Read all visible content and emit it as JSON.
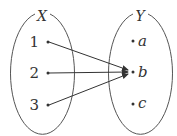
{
  "diagram": {
    "type": "mapping",
    "stroke_color": "#444444",
    "sets": [
      {
        "name": "X",
        "elements": [
          "1",
          "2",
          "3"
        ]
      },
      {
        "name": "Y",
        "elements": [
          "a",
          "b",
          "c"
        ]
      }
    ],
    "mappings": [
      {
        "from": "1",
        "to": "b"
      },
      {
        "from": "2",
        "to": "b"
      },
      {
        "from": "3",
        "to": "b"
      }
    ]
  },
  "labels": {
    "set_x": "X",
    "set_y": "Y",
    "x1": "1",
    "x2": "2",
    "x3": "3",
    "ya": "a",
    "yb": "b",
    "yc": "c"
  }
}
